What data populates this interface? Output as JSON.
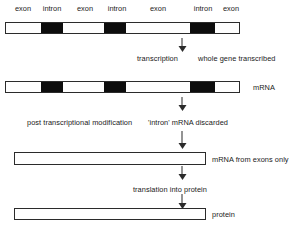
{
  "diagram": {
    "gene_segments": [
      {
        "label": "exon",
        "type": "exon",
        "x": 5,
        "w": 36
      },
      {
        "label": "intron",
        "type": "intron",
        "x": 41,
        "w": 22
      },
      {
        "label": "exon",
        "type": "exon",
        "x": 63,
        "w": 41
      },
      {
        "label": "intron",
        "type": "intron",
        "x": 104,
        "w": 22
      },
      {
        "label": "exon",
        "type": "exon",
        "x": 126,
        "w": 64
      },
      {
        "label": "intron",
        "type": "intron",
        "x": 190,
        "w": 25
      },
      {
        "label": "exon",
        "type": "exon",
        "x": 215,
        "w": 25
      }
    ],
    "steps": [
      {
        "name": "transcription",
        "action_label": "transcription",
        "note_label": "whole gene transcribed"
      },
      {
        "name": "post-transcriptional-modification",
        "action_label": "post transcriptional modification",
        "note_label": "'intron' mRNA discarded"
      },
      {
        "name": "translation",
        "action_label": "translation into protein",
        "note_label": ""
      }
    ],
    "products": [
      {
        "name": "mrna",
        "label": "mRNA"
      },
      {
        "name": "mrna-exons-only",
        "label": "mRNA from exons only"
      },
      {
        "name": "protein",
        "label": "protein"
      }
    ],
    "colors": {
      "exon": "#ffffff",
      "intron": "#0d0d0d",
      "outline": "#2b2b2b",
      "text": "#1a1a1a",
      "background": "#ffffff"
    }
  }
}
